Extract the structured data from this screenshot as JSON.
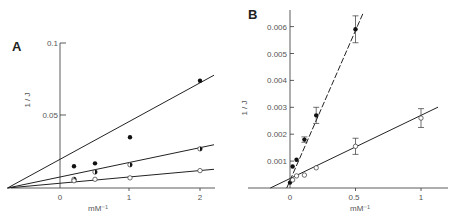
{
  "chart_data": [
    {
      "panel": "A",
      "type": "scatter",
      "title": "",
      "xlabel": "mM⁻¹",
      "ylabel": "1 / J",
      "xlim": [
        -0.75,
        2.2
      ],
      "ylim": [
        0,
        0.1
      ],
      "xticks": [
        "0",
        "1",
        "2"
      ],
      "yticks": [
        "0.05",
        "0.1"
      ],
      "grid": false,
      "legend": null,
      "series": [
        {
          "name": "filled circles",
          "marker": "filled",
          "x": [
            0.2,
            0.5,
            1,
            2
          ],
          "y": [
            0.015,
            0.017,
            0.035,
            0.074
          ],
          "fit": {
            "slope": 0.034,
            "intercept": 0.003
          }
        },
        {
          "name": "half-filled circles",
          "marker": "half",
          "x": [
            0.2,
            0.5,
            1,
            2
          ],
          "y": [
            0.006,
            0.011,
            0.016,
            0.027
          ],
          "fit": {
            "slope": 0.0122,
            "intercept": 0.003
          }
        },
        {
          "name": "open circles",
          "marker": "open",
          "x": [
            0.2,
            0.5,
            1,
            2
          ],
          "y": [
            0.005,
            0.006,
            0.007,
            0.012
          ],
          "fit": {
            "slope": 0.0045,
            "intercept": 0.003
          }
        }
      ]
    },
    {
      "panel": "B",
      "type": "scatter",
      "title": "",
      "xlabel": "mM⁻¹",
      "ylabel": "1 / J",
      "xlim": [
        -0.2,
        1.15
      ],
      "ylim": [
        0,
        0.0065
      ],
      "xticks": [
        "0",
        "0.5",
        "1"
      ],
      "yticks": [
        "0.001",
        "0.002",
        "0.003",
        "0.004",
        "0.005",
        "0.006"
      ],
      "grid": false,
      "legend": null,
      "series": [
        {
          "name": "filled circles",
          "marker": "filled",
          "x": [
            0,
            0.02,
            0.05,
            0.11,
            0.2,
            0.5
          ],
          "y": [
            0.0002,
            0.0008,
            0.00105,
            0.0018,
            0.0027,
            0.0059
          ],
          "err": [
            0,
            0,
            0,
            0.0001,
            0.0003,
            0.0005
          ],
          "fit": {
            "slope": 0.0112,
            "intercept": 0.00025
          }
        },
        {
          "name": "open circles",
          "marker": "open",
          "x": [
            0.02,
            0.05,
            0.11,
            0.2,
            0.5,
            1
          ],
          "y": [
            0.0003,
            0.00045,
            0.00048,
            0.00075,
            0.00155,
            0.0026
          ],
          "err": [
            0,
            0,
            0,
            0,
            0.0003,
            0.00035
          ],
          "fit": {
            "slope": 0.00235,
            "intercept": 0.00035
          }
        }
      ]
    }
  ],
  "labels": {
    "panel_a": "A",
    "panel_b": "B",
    "a_ylabel": "1 / J",
    "b_ylabel": "1 / J",
    "a_xlabel": "mM⁻¹",
    "b_xlabel": "mM⁻¹",
    "a_xticks": [
      "0",
      "1",
      "2"
    ],
    "a_yticks": [
      "0.05",
      "0.1"
    ],
    "b_xticks": [
      "0",
      "0.5",
      "1"
    ],
    "b_yticks": [
      "0.001",
      "0.002",
      "0.003",
      "0.004",
      "0.005",
      "0.006"
    ]
  }
}
